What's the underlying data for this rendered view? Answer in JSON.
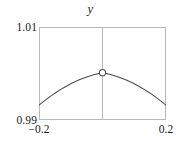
{
  "chart_data": {
    "type": "line",
    "title": "y",
    "xlabel": "",
    "ylabel": "",
    "xlim": [
      -0.2,
      0.2
    ],
    "ylim": [
      0.99,
      1.01
    ],
    "xticks": [
      "−0.2",
      "0.2"
    ],
    "xtick_values": [
      -0.2,
      0.2
    ],
    "yticks": [
      "0.99",
      "1.01"
    ],
    "ytick_values": [
      0.99,
      1.01
    ],
    "grid": false,
    "legend": null,
    "series": [
      {
        "name": "curve",
        "type": "line",
        "color": "#4d4d4d",
        "x": [
          -0.2,
          -0.175,
          -0.15,
          -0.125,
          -0.1,
          -0.075,
          -0.05,
          -0.025,
          0,
          0.025,
          0.05,
          0.075,
          0.1,
          0.125,
          0.15,
          0.175,
          0.2
        ],
        "values": [
          0.9932,
          0.99455,
          0.99577,
          0.99685,
          0.99779,
          0.99859,
          0.99926,
          0.99979,
          1.00018,
          0.99979,
          0.99926,
          0.99859,
          0.99779,
          0.99685,
          0.99577,
          0.99455,
          0.9932
        ]
      }
    ],
    "markers": [
      {
        "name": "apex-marker",
        "x": 0,
        "y": 1.00018,
        "style": "open-circle",
        "facecolor": "#ffffff",
        "edgecolor": "#4d4d4d"
      }
    ],
    "reference_lines": [
      {
        "name": "vertical-center-line",
        "orientation": "vertical",
        "x": 0,
        "color": "#b9b9b9"
      }
    ],
    "frame_color": "#b9b9b9"
  }
}
